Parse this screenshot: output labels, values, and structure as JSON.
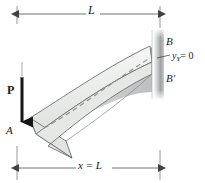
{
  "figure": {
    "kind": "cantilever-beam-deflection-diagram",
    "background_color": "#ffffff",
    "line_color": "#1a1a1a"
  },
  "labels": {
    "length_top": "L",
    "distance_bottom": "x = L",
    "support_point": "B",
    "deflected_point": "B′",
    "slope_condition_var": "y",
    "slope_condition_sub": "Y",
    "slope_condition_eq": "= 0",
    "load": "P",
    "free_end": "A"
  },
  "colors": {
    "beam_fill": "#eceeec",
    "beam_stroke": "#6d6f70",
    "shadow_fill": "#9a9c9d",
    "wall_light": "#f0f1f1",
    "wall_mid": "#a8aaab",
    "wall_dark": "#86888a",
    "dashed_line": "#8e9091",
    "dimension_line": "#4a4c4d",
    "arrow_black": "#151515"
  },
  "geometry": {
    "top_dimension_y": 14,
    "bottom_dimension_y": 168,
    "left_extension_x": 17,
    "right_extension_x": 160,
    "wall_x": 152,
    "wall_top": 28,
    "wall_bottom": 100,
    "wall_width": 12
  }
}
